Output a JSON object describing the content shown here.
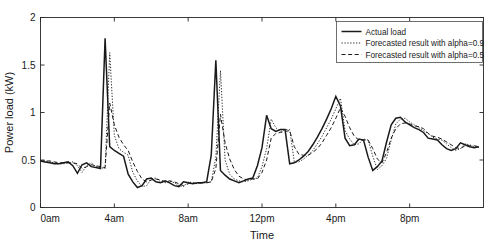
{
  "figure": {
    "background_color": "#ffffff",
    "axes_color": "#262626",
    "line_color": "#1a1a1a"
  },
  "chart_data": {
    "type": "line",
    "title": "",
    "xlabel": "Time",
    "ylabel": "Power load (kW)",
    "xlim": [
      0,
      24
    ],
    "ylim": [
      0,
      2
    ],
    "grid": false,
    "legend_position": "top-right",
    "x_tick_values": [
      0,
      4,
      8,
      12,
      16,
      20
    ],
    "x_tick_labels": [
      "0am",
      "4am",
      "8am",
      "12pm",
      "4pm",
      "8pm"
    ],
    "y_tick_values": [
      0,
      0.5,
      1,
      1.5,
      2
    ],
    "y_tick_labels": [
      "0",
      "0.5",
      "1",
      "1.5",
      "2"
    ],
    "x": [
      0,
      0.25,
      0.5,
      0.75,
      1,
      1.25,
      1.5,
      1.75,
      2,
      2.25,
      2.5,
      2.75,
      3,
      3.25,
      3.5,
      3.75,
      4,
      4.25,
      4.5,
      4.75,
      5,
      5.25,
      5.5,
      5.75,
      6,
      6.25,
      6.5,
      6.75,
      7,
      7.25,
      7.5,
      7.75,
      8,
      8.25,
      8.5,
      8.75,
      9,
      9.25,
      9.5,
      9.75,
      10,
      10.25,
      10.5,
      10.75,
      11,
      11.25,
      11.5,
      11.75,
      12,
      12.25,
      12.5,
      12.75,
      13,
      13.25,
      13.5,
      13.75,
      14,
      14.25,
      14.5,
      14.75,
      15,
      15.25,
      15.5,
      15.75,
      16,
      16.25,
      16.5,
      16.75,
      17,
      17.25,
      17.5,
      17.75,
      18,
      18.25,
      18.5,
      18.75,
      19,
      19.25,
      19.5,
      19.75,
      20,
      20.25,
      20.5,
      20.75,
      21,
      21.25,
      21.5,
      21.75,
      22,
      22.25,
      22.5,
      22.75,
      23,
      23.25,
      23.5,
      23.75
    ],
    "series": [
      {
        "name": "Actual load",
        "style": "solid",
        "color": "#1a1a1a",
        "width": 1.5,
        "values": [
          0.49,
          0.48,
          0.47,
          0.46,
          0.46,
          0.47,
          0.48,
          0.44,
          0.36,
          0.45,
          0.47,
          0.43,
          0.42,
          0.41,
          1.78,
          0.64,
          0.6,
          0.57,
          0.54,
          0.35,
          0.27,
          0.21,
          0.23,
          0.3,
          0.31,
          0.27,
          0.26,
          0.28,
          0.26,
          0.23,
          0.22,
          0.27,
          0.26,
          0.25,
          0.26,
          0.26,
          0.27,
          0.55,
          1.55,
          0.39,
          0.34,
          0.3,
          0.28,
          0.26,
          0.28,
          0.3,
          0.31,
          0.44,
          0.63,
          0.97,
          0.83,
          0.8,
          0.82,
          0.82,
          0.46,
          0.47,
          0.5,
          0.54,
          0.59,
          0.66,
          0.74,
          0.83,
          0.93,
          1.04,
          1.17,
          1.07,
          0.73,
          0.65,
          0.66,
          0.72,
          0.71,
          0.53,
          0.39,
          0.43,
          0.49,
          0.69,
          0.87,
          0.94,
          0.95,
          0.9,
          0.87,
          0.84,
          0.82,
          0.79,
          0.73,
          0.72,
          0.71,
          0.66,
          0.62,
          0.6,
          0.62,
          0.68,
          0.66,
          0.64,
          0.63,
          0.64
        ]
      },
      {
        "name": "Forecasted result with alpha=0.9",
        "style": "dotted",
        "color": "#4d4d4d",
        "width": 0.9,
        "values": [
          0.49,
          0.49,
          0.48,
          0.47,
          0.46,
          0.46,
          0.47,
          0.48,
          0.44,
          0.37,
          0.44,
          0.47,
          0.43,
          0.42,
          0.41,
          1.63,
          0.76,
          0.62,
          0.58,
          0.55,
          0.37,
          0.28,
          0.22,
          0.23,
          0.3,
          0.31,
          0.27,
          0.26,
          0.28,
          0.26,
          0.23,
          0.22,
          0.27,
          0.26,
          0.25,
          0.26,
          0.26,
          0.27,
          0.53,
          1.44,
          0.5,
          0.35,
          0.3,
          0.28,
          0.27,
          0.28,
          0.3,
          0.31,
          0.43,
          0.62,
          0.93,
          0.84,
          0.8,
          0.82,
          0.82,
          0.48,
          0.48,
          0.51,
          0.55,
          0.6,
          0.67,
          0.75,
          0.84,
          0.93,
          1.04,
          1.15,
          0.81,
          0.72,
          0.66,
          0.67,
          0.72,
          0.71,
          0.54,
          0.4,
          0.44,
          0.52,
          0.71,
          0.88,
          0.93,
          0.94,
          0.9,
          0.87,
          0.84,
          0.81,
          0.78,
          0.74,
          0.72,
          0.71,
          0.67,
          0.63,
          0.6,
          0.62,
          0.67,
          0.66,
          0.64,
          0.63
        ]
      },
      {
        "name": "Forecasted result with alpha=0.5",
        "style": "dashed",
        "color": "#333333",
        "width": 1.0,
        "values": [
          0.49,
          0.49,
          0.49,
          0.48,
          0.47,
          0.47,
          0.47,
          0.47,
          0.46,
          0.41,
          0.43,
          0.45,
          0.44,
          0.43,
          0.42,
          1.1,
          0.87,
          0.74,
          0.66,
          0.6,
          0.48,
          0.38,
          0.3,
          0.27,
          0.29,
          0.3,
          0.29,
          0.27,
          0.28,
          0.27,
          0.25,
          0.23,
          0.25,
          0.26,
          0.25,
          0.26,
          0.26,
          0.27,
          0.41,
          0.98,
          0.68,
          0.51,
          0.4,
          0.33,
          0.3,
          0.29,
          0.3,
          0.3,
          0.37,
          0.5,
          0.73,
          0.78,
          0.79,
          0.8,
          0.81,
          0.64,
          0.56,
          0.55,
          0.55,
          0.58,
          0.62,
          0.68,
          0.76,
          0.84,
          0.94,
          1.05,
          0.96,
          0.84,
          0.75,
          0.71,
          0.71,
          0.71,
          0.62,
          0.51,
          0.47,
          0.58,
          0.73,
          0.83,
          0.88,
          0.89,
          0.88,
          0.86,
          0.85,
          0.83,
          0.78,
          0.75,
          0.74,
          0.72,
          0.69,
          0.66,
          0.63,
          0.62,
          0.65,
          0.65,
          0.65,
          0.64
        ]
      }
    ]
  }
}
